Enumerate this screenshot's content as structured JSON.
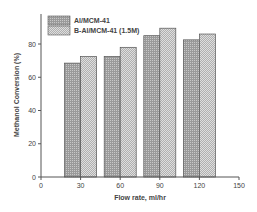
{
  "chart_data": {
    "type": "bar",
    "title": "",
    "xlabel": "Flow rate, ml/hr",
    "ylabel": "Methanol Conversion (%)",
    "categories": [
      "30",
      "60",
      "90",
      "120"
    ],
    "x": [
      30,
      60,
      90,
      120
    ],
    "series": [
      {
        "name": "Al/MCM-41",
        "values": [
          68.5,
          72.5,
          85,
          82.5
        ]
      },
      {
        "name": "B-Al/MCM-41 (1.5M)",
        "values": [
          72.5,
          78,
          89.5,
          86
        ]
      }
    ],
    "xlim": [
      0,
      150
    ],
    "ylim": [
      0,
      95
    ],
    "xticks": [
      "0",
      "30",
      "60",
      "90",
      "120",
      "150"
    ],
    "yticks": [
      "0",
      "20",
      "40",
      "60",
      "80"
    ],
    "grid": false,
    "legend_position": "top-left"
  }
}
